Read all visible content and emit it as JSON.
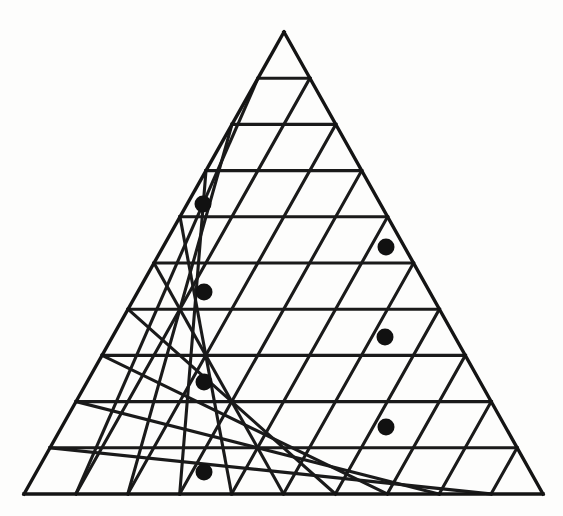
{
  "figure": {
    "background_color": "#fdfdfc",
    "line_color": "#1a1a1a",
    "dot_color": "#111111",
    "line_width": 3.1
  },
  "geometry": {
    "apex": {
      "x": 284,
      "y": 32
    },
    "base_left": {
      "x": 24,
      "y": 494
    },
    "base_right": {
      "x": 543,
      "y": 494
    },
    "rows": 10,
    "row_height": 46.2,
    "half_cell_width": 25.95,
    "total_unit_triangles": 100,
    "upward_triangles": 55,
    "downward_triangles": 45
  },
  "chart_data": {
    "type": "scatter",
    "xlabel": "",
    "ylabel": "",
    "grid": true,
    "legend": "none",
    "xlim": [
      0,
      563
    ],
    "ylim": [
      516,
      0
    ],
    "series": [
      {
        "name": "markers",
        "marker": "filled-circle",
        "color": "#111111",
        "radius": 8.5,
        "points": [
          {
            "label": "dot-1",
            "x": 203,
            "y": 204,
            "row": 4,
            "cell": 2,
            "orientation": "up"
          },
          {
            "label": "dot-2",
            "x": 386,
            "y": 247,
            "row": 5,
            "cell": 8,
            "orientation": "up"
          },
          {
            "label": "dot-3",
            "x": 204,
            "y": 292,
            "row": 6,
            "cell": 4,
            "orientation": "up"
          },
          {
            "label": "dot-4",
            "x": 385,
            "y": 337,
            "row": 7,
            "cell": 10,
            "orientation": "up"
          },
          {
            "label": "dot-5",
            "x": 204,
            "y": 382,
            "row": 8,
            "cell": 6,
            "orientation": "up"
          },
          {
            "label": "dot-6",
            "x": 386,
            "y": 427,
            "row": 9,
            "cell": 12,
            "orientation": "up"
          },
          {
            "label": "dot-7",
            "x": 204,
            "y": 472,
            "row": 10,
            "cell": 8,
            "orientation": "up"
          }
        ]
      }
    ],
    "rows_detail": [
      {
        "row": 1,
        "triangles": 1,
        "top_y": 32,
        "bottom_y": 78.2
      },
      {
        "row": 2,
        "triangles": 3,
        "top_y": 78.2,
        "bottom_y": 124.4
      },
      {
        "row": 3,
        "triangles": 5,
        "top_y": 124.4,
        "bottom_y": 170.6
      },
      {
        "row": 4,
        "triangles": 7,
        "top_y": 170.6,
        "bottom_y": 216.8
      },
      {
        "row": 5,
        "triangles": 9,
        "top_y": 216.8,
        "bottom_y": 263.0
      },
      {
        "row": 6,
        "triangles": 11,
        "top_y": 263.0,
        "bottom_y": 309.2
      },
      {
        "row": 7,
        "triangles": 13,
        "top_y": 309.2,
        "bottom_y": 355.4
      },
      {
        "row": 8,
        "triangles": 15,
        "top_y": 355.4,
        "bottom_y": 401.6
      },
      {
        "row": 9,
        "triangles": 17,
        "top_y": 401.6,
        "bottom_y": 447.8
      },
      {
        "row": 10,
        "triangles": 19,
        "top_y": 447.8,
        "bottom_y": 494.0
      }
    ],
    "marked_count": 7
  }
}
